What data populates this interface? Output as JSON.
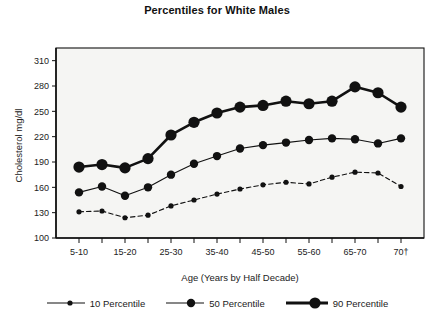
{
  "chart_data": {
    "type": "line",
    "title": "Percentiles for White Males",
    "xlabel": "Age (Years by Half Decade)",
    "ylabel": "Cholesterol  mg/dl",
    "ylim": [
      100,
      325
    ],
    "yticks": [
      100,
      130,
      160,
      190,
      220,
      250,
      280,
      310
    ],
    "grid": false,
    "legend_position": "bottom",
    "x": [
      1,
      2,
      3,
      4,
      5,
      6,
      7,
      8,
      9,
      10,
      11,
      12,
      13,
      14,
      15
    ],
    "categories": [
      "5-10",
      "10-15",
      "15-20",
      "20-25",
      "25-30",
      "30-35",
      "35-40",
      "40-45",
      "45-50",
      "50-55",
      "55-60",
      "60-65",
      "65-70",
      "70-75",
      "70+"
    ],
    "xtick_labels": [
      "5-10",
      "",
      "15-20",
      "",
      "25-30",
      "",
      "35-40",
      "",
      "45-50",
      "",
      "55-60",
      "",
      "65-70",
      "",
      "70†"
    ],
    "series": [
      {
        "name": "10 Percentile",
        "values": [
          131,
          132,
          124,
          127,
          138,
          145,
          152,
          158,
          163,
          166,
          164,
          172,
          178,
          177,
          161
        ],
        "line_style": "dashed",
        "line_width": 1.1,
        "marker_size": 2.6
      },
      {
        "name": "50 Percentile",
        "values": [
          154,
          161,
          150,
          160,
          175,
          188,
          197,
          206,
          210,
          213,
          216,
          218,
          217,
          212,
          218
        ],
        "line_style": "solid",
        "line_width": 1.1,
        "marker_size": 4.2
      },
      {
        "name": "90 Percentile",
        "values": [
          184,
          187,
          183,
          194,
          222,
          237,
          248,
          255,
          257,
          262,
          259,
          262,
          279,
          272,
          255
        ],
        "line_style": "solid",
        "line_width": 2.6,
        "marker_size": 5.6
      }
    ]
  },
  "legend": {
    "items": [
      {
        "label": "10 Percentile"
      },
      {
        "label": "50 Percentile"
      },
      {
        "label": "90 Percentile"
      }
    ]
  },
  "colors": {
    "ink": "#111111",
    "plot_background": "#f5f5f3",
    "axis": "#1a1a1a"
  }
}
